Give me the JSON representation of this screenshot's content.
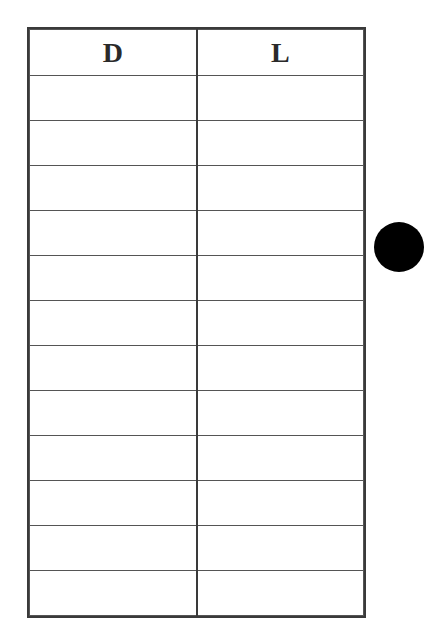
{
  "table": {
    "headers": [
      "D",
      "L"
    ],
    "row_count": 12,
    "rows": [
      [
        "",
        ""
      ],
      [
        "",
        ""
      ],
      [
        "",
        ""
      ],
      [
        "",
        ""
      ],
      [
        "",
        ""
      ],
      [
        "",
        ""
      ],
      [
        "",
        ""
      ],
      [
        "",
        ""
      ],
      [
        "",
        ""
      ],
      [
        "",
        ""
      ],
      [
        "",
        ""
      ],
      [
        "",
        ""
      ]
    ]
  },
  "marker": {
    "shape": "circle",
    "color": "#000000"
  }
}
